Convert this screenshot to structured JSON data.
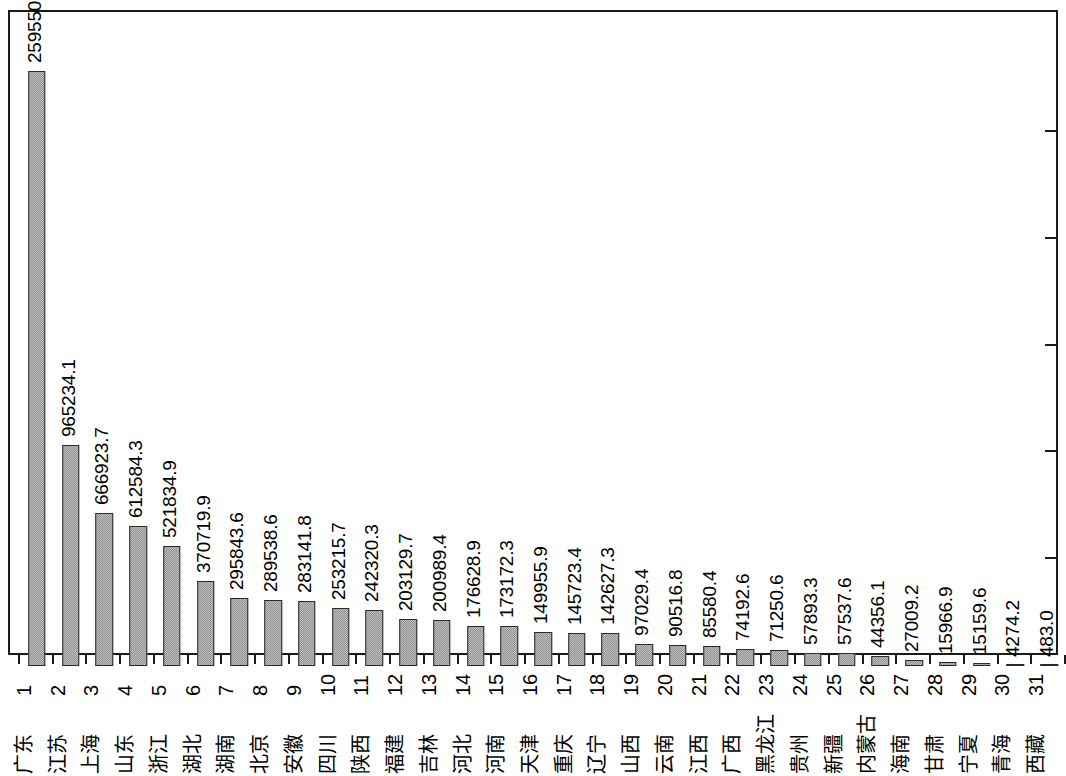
{
  "chart_data": {
    "type": "bar",
    "title": "",
    "subtitle": "",
    "xlabel": "",
    "ylabel": "",
    "orientation": "vertical",
    "grid": false,
    "legend": false,
    "legend_position": "none",
    "axis": {
      "y_min": 0,
      "y_max": 2800000,
      "y_tick_count": 5,
      "y_ticks_labeled": false,
      "y_tick_side": "right",
      "x_tick_labels_are_ranks": true
    },
    "style": {
      "bar_fill": "#9d9d9d",
      "bar_edge": "#2b2b2b",
      "frame_color": "#1a1a1a",
      "background": "#ffffff",
      "text_color": "#000000",
      "label_rotation_deg": -90
    },
    "categories": [
      "广东",
      "江苏",
      "上海",
      "山东",
      "浙江",
      "湖北",
      "湖南",
      "北京",
      "安徽",
      "四川",
      "陕西",
      "福建",
      "吉林",
      "河北",
      "河南",
      "天津",
      "重庆",
      "辽宁",
      "山西",
      "云南",
      "江西",
      "广西",
      "黑龙江",
      "贵州",
      "新疆",
      "内蒙古",
      "海南",
      "甘肃",
      "宁夏",
      "青海",
      "西藏"
    ],
    "ranks": [
      "1",
      "2",
      "3",
      "4",
      "5",
      "6",
      "7",
      "8",
      "9",
      "10",
      "11",
      "12",
      "13",
      "14",
      "15",
      "16",
      "17",
      "18",
      "19",
      "20",
      "21",
      "22",
      "23",
      "24",
      "25",
      "26",
      "27",
      "28",
      "29",
      "30",
      "31"
    ],
    "values": [
      2595506.9,
      965234.1,
      666923.7,
      612584.3,
      521834.9,
      370719.9,
      295843.6,
      289538.6,
      283141.8,
      253215.7,
      242320.3,
      203129.7,
      200989.4,
      176628.9,
      173172.3,
      149955.9,
      145723.4,
      142627.3,
      97029.4,
      90516.8,
      85580.4,
      74192.6,
      71250.6,
      57893.3,
      57537.6,
      44356.1,
      27009.2,
      15966.9,
      15159.6,
      4274.2,
      483.0
    ],
    "value_labels": [
      "2595506.9",
      "965234.1",
      "666923.7",
      "612584.3",
      "521834.9",
      "370719.9",
      "295843.6",
      "289538.6",
      "283141.8",
      "253215.7",
      "242320.3",
      "203129.7",
      "200989.4",
      "176628.9",
      "173172.3",
      "149955.9",
      "145723.4",
      "142627.3",
      "97029.4",
      "90516.8",
      "85580.4",
      "74192.6",
      "71250.6",
      "57893.3",
      "57537.6",
      "44356.1",
      "27009.2",
      "15966.9",
      "15159.6",
      "4274.2",
      "483.0"
    ]
  }
}
